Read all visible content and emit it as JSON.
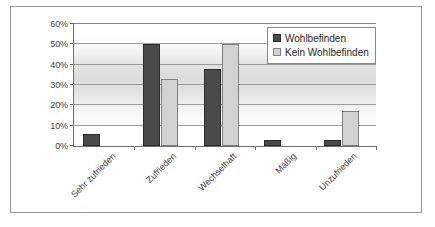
{
  "chart_data": {
    "type": "bar",
    "title": "",
    "subtitle": "",
    "xlabel": "",
    "ylabel": "",
    "categories": [
      "Sehr zufrieden",
      "Zufrieden",
      "Wechselhaft",
      "Mäßig",
      "Unzufrieden"
    ],
    "series": [
      {
        "name": "Wohlbefinden",
        "color": "#4a4a4a",
        "values": [
          6,
          50,
          38,
          3,
          3
        ]
      },
      {
        "name": "Kein Wohlbefinden",
        "color": "#d2d2d2",
        "values": [
          0,
          33,
          50,
          0,
          17
        ]
      }
    ],
    "ylim": [
      0,
      60
    ],
    "ytick_labels": [
      "0%",
      "10%",
      "20%",
      "30%",
      "40%",
      "50%",
      "60%"
    ],
    "ytick_values": [
      0,
      10,
      20,
      30,
      40,
      50,
      60
    ],
    "grid": true,
    "legend_position": "top-right"
  },
  "legend": {
    "entries": [
      {
        "label": "Wohlbefinden"
      },
      {
        "label": "Kein Wohlbefinden"
      }
    ]
  }
}
